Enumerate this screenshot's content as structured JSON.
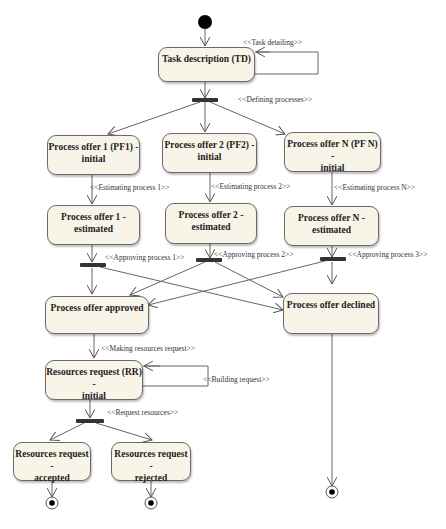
{
  "diagram": {
    "type": "UML activity diagram",
    "nodes": {
      "td": {
        "line1": "Task description (TD)",
        "line2": ""
      },
      "pf1_init": {
        "line1": "Process offer 1 (PF1) -",
        "line2": "initial"
      },
      "pf2_init": {
        "line1": "Process offer 2 (PF2) -",
        "line2": "initial"
      },
      "pfn_init": {
        "line1": "Process offer N (PF N) -",
        "line2": "initial"
      },
      "pf1_est": {
        "line1": "Process offer 1 -",
        "line2": "estimated"
      },
      "pf2_est": {
        "line1": "Process offer 2 -",
        "line2": "estimated"
      },
      "pfn_est": {
        "line1": "Process offer N -",
        "line2": "estimated"
      },
      "approved": {
        "line1": "Process offer approved",
        "line2": ""
      },
      "declined": {
        "line1": "Process offer declined",
        "line2": ""
      },
      "rr_init": {
        "line1": "Resources request (RR) -",
        "line2": "initial"
      },
      "rr_acc": {
        "line1": "Resources request -",
        "line2": "accepted"
      },
      "rr_rej": {
        "line1": "Resources request -",
        "line2": "rejected"
      }
    },
    "labels": {
      "task_detailing": "<<Task detailing>>",
      "defining_processes": "<<Defining processes>>",
      "estimating_1": "<<Estimating process 1>>",
      "estimating_2": "<<Estimating process 2>>",
      "estimating_n": "<<Estimating process N>>",
      "approving_1": "<<Approving process 1>>",
      "approving_2": "<<Approving process 2>>",
      "approving_3": "<<Approving process 3>>",
      "making_request": "<<Making resources request>>",
      "building_request": "<<Building request>>",
      "request_resources": "<<Request resources>>"
    },
    "colors": {
      "node_fill": "#f8f5e8",
      "node_border": "#6a6a6a",
      "edge": "#555555",
      "bar": "#333333"
    }
  }
}
